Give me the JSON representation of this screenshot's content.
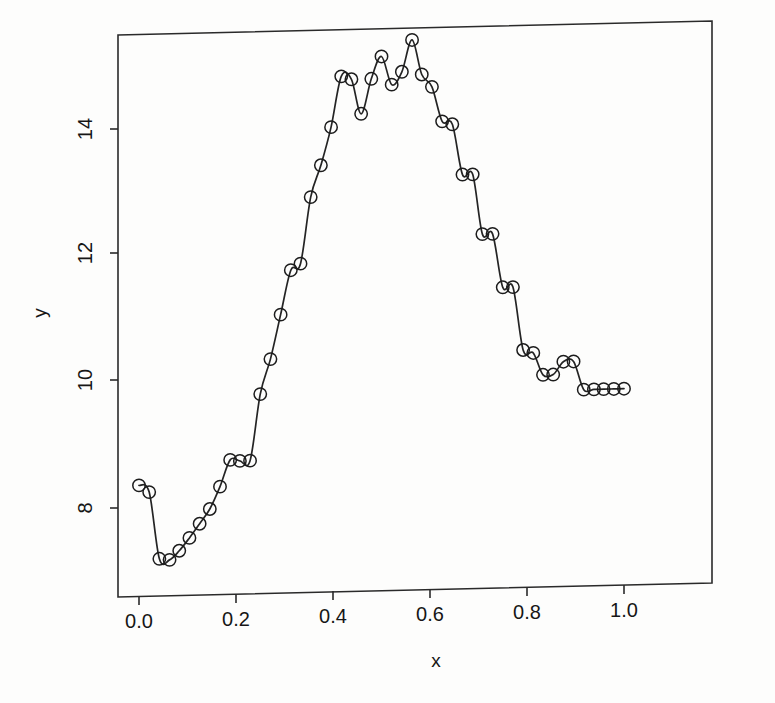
{
  "chart_data": {
    "type": "scatter",
    "title": "",
    "subtitle": "",
    "xlabel": "x",
    "ylabel": "y",
    "xlim": [
      -0.04,
      1.04
    ],
    "ylim": [
      6.75,
      15.45
    ],
    "xticks": [
      0.0,
      0.2,
      0.4,
      0.6,
      0.8,
      1.0
    ],
    "xticklabels": [
      "0.0",
      "0.2",
      "0.4",
      "0.6",
      "0.8",
      "1.0"
    ],
    "yticks": [
      8,
      10,
      12,
      14
    ],
    "yticklabels": [
      "8",
      "10",
      "12",
      "14"
    ],
    "grid": false,
    "legend": null,
    "marker": "open-circle",
    "series": [
      {
        "name": "observations",
        "style": "points-with-smooth-curve",
        "x": [
          0.0,
          0.021,
          0.042,
          0.063,
          0.083,
          0.104,
          0.125,
          0.146,
          0.167,
          0.188,
          0.208,
          0.229,
          0.25,
          0.271,
          0.292,
          0.313,
          0.333,
          0.354,
          0.375,
          0.396,
          0.417,
          0.438,
          0.458,
          0.479,
          0.5,
          0.521,
          0.542,
          0.563,
          0.583,
          0.604,
          0.625,
          0.646,
          0.667,
          0.688,
          0.708,
          0.729,
          0.75,
          0.771,
          0.792,
          0.813,
          0.833,
          0.854,
          0.875,
          0.896,
          0.917,
          0.938,
          0.958,
          0.979,
          1.0
        ],
        "y": [
          8.35,
          8.24,
          7.18,
          7.16,
          7.3,
          7.5,
          7.72,
          7.95,
          8.3,
          8.72,
          8.7,
          8.7,
          9.75,
          10.3,
          11.0,
          11.7,
          11.8,
          12.85,
          13.35,
          13.95,
          14.75,
          14.7,
          14.15,
          14.7,
          15.05,
          14.6,
          14.8,
          15.3,
          14.75,
          14.55,
          14.0,
          13.95,
          13.15,
          13.15,
          12.2,
          12.2,
          11.35,
          11.35,
          10.35,
          10.3,
          9.95,
          9.95,
          10.15,
          10.15,
          9.7,
          9.7,
          9.7,
          9.7,
          9.7
        ]
      }
    ]
  },
  "figure": {
    "axis_labels": {
      "x": "x",
      "y": "y"
    },
    "tick_labels": {
      "x": [
        "0.0",
        "0.2",
        "0.4",
        "0.6",
        "0.8",
        "1.0"
      ],
      "y": [
        "8",
        "10",
        "12",
        "14"
      ]
    },
    "colors": {
      "line": "#242424",
      "marker": "#1c1c1c",
      "frame": "#2a2a2a",
      "background": "#fdfdfc",
      "text": "#161616"
    }
  }
}
